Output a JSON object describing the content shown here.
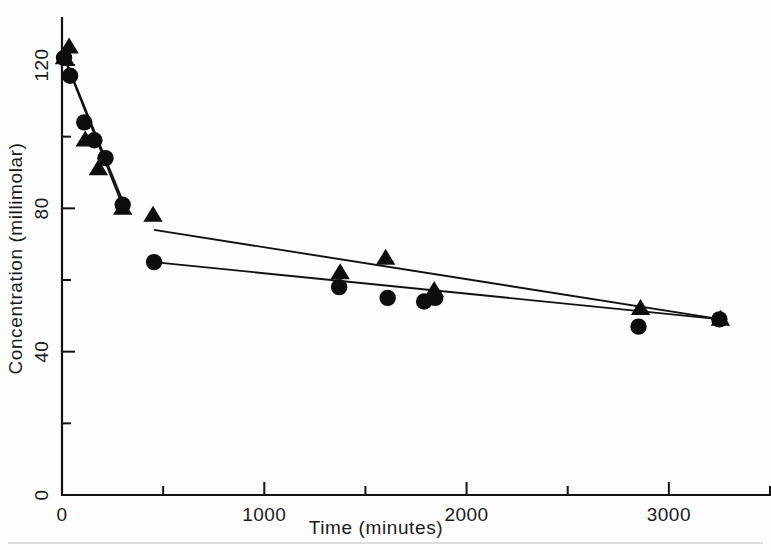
{
  "figure": {
    "background_color": "#fdfdfd",
    "ink_color": "#111111"
  },
  "chart_data": {
    "type": "scatter",
    "title": "",
    "xlabel": "Time (minutes)",
    "ylabel": "Concentration (millimolar)",
    "xlim": [
      0,
      3500
    ],
    "ylim": [
      0,
      132
    ],
    "grid": false,
    "legend": "none",
    "x_major_ticks": [
      0,
      1000,
      2000,
      3000
    ],
    "x_major_tick_labels": [
      "0",
      "1000",
      "2000",
      "3000"
    ],
    "x_minor_ticks": [
      500,
      1500,
      2500,
      3500
    ],
    "y_major_ticks": [
      0,
      40,
      80,
      120
    ],
    "y_major_tick_labels": [
      "0",
      "40",
      "80",
      "120"
    ],
    "y_minor_ticks": [
      20,
      60,
      100
    ],
    "series": [
      {
        "name": "circle-series",
        "marker": "filled-circle",
        "points": [
          {
            "x": 10,
            "y": 122
          },
          {
            "x": 40,
            "y": 117
          },
          {
            "x": 110,
            "y": 104
          },
          {
            "x": 160,
            "y": 99
          },
          {
            "x": 215,
            "y": 94
          },
          {
            "x": 300,
            "y": 81
          },
          {
            "x": 455,
            "y": 65
          },
          {
            "x": 1370,
            "y": 58
          },
          {
            "x": 1610,
            "y": 55
          },
          {
            "x": 1790,
            "y": 54
          },
          {
            "x": 1845,
            "y": 55
          },
          {
            "x": 2850,
            "y": 47
          },
          {
            "x": 3250,
            "y": 49
          }
        ]
      },
      {
        "name": "triangle-series",
        "marker": "filled-triangle",
        "points": [
          {
            "x": 35,
            "y": 125
          },
          {
            "x": 12,
            "y": 122
          },
          {
            "x": 115,
            "y": 99
          },
          {
            "x": 180,
            "y": 91
          },
          {
            "x": 300,
            "y": 80
          },
          {
            "x": 450,
            "y": 78
          },
          {
            "x": 1375,
            "y": 62
          },
          {
            "x": 1600,
            "y": 66
          },
          {
            "x": 1840,
            "y": 57
          },
          {
            "x": 2860,
            "y": 52
          },
          {
            "x": 3255,
            "y": 49
          }
        ]
      }
    ],
    "fit_lines": [
      {
        "name": "phase1-fit-a",
        "x1": 20,
        "y1": 121,
        "x2": 300,
        "y2": 82
      },
      {
        "name": "phase1-fit-b",
        "x1": 25,
        "y1": 120,
        "x2": 305,
        "y2": 80
      },
      {
        "name": "phase2-fit-upper",
        "x1": 455,
        "y1": 74,
        "x2": 3260,
        "y2": 49
      },
      {
        "name": "phase2-fit-lower",
        "x1": 455,
        "y1": 65,
        "x2": 3260,
        "y2": 49
      }
    ]
  }
}
